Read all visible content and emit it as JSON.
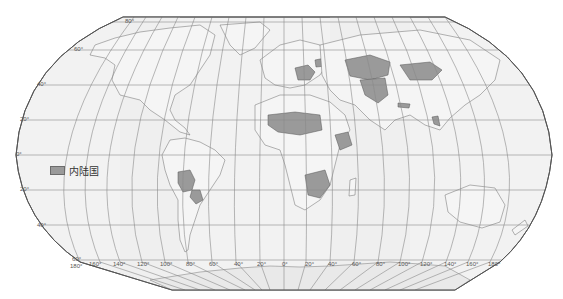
{
  "map": {
    "projection": "Robinson-like world projection",
    "background_color": "#f1f1f1",
    "land_fill": "#f4f4f4",
    "highlight_fill": "#9a9a9a",
    "border_color": "#6a6a6a",
    "graticule_color": "#8a8a8a"
  },
  "legend": {
    "label": "内陆国",
    "swatch_color": "#9a9a9a"
  },
  "latitude_labels": [
    {
      "text": "80°",
      "x": 66,
      "y": 22
    },
    {
      "text": "60°",
      "x": 15,
      "y": 48
    },
    {
      "text": "40°",
      "x": 37,
      "y": 85
    },
    {
      "text": "20°",
      "x": 19,
      "y": 119
    },
    {
      "text": "0°",
      "x": 16,
      "y": 154
    },
    {
      "text": "20°",
      "x": 19,
      "y": 189
    },
    {
      "text": "40°",
      "x": 37,
      "y": 224
    },
    {
      "text": "60°",
      "x": 72,
      "y": 256
    }
  ],
  "longitude_labels": [
    {
      "text": "180°",
      "x": 71,
      "y": 262
    },
    {
      "text": "160°",
      "x": 89,
      "y": 262
    },
    {
      "text": "140°",
      "x": 113,
      "y": 262
    },
    {
      "text": "120°",
      "x": 137,
      "y": 262
    },
    {
      "text": "100°",
      "x": 160,
      "y": 262
    },
    {
      "text": "80°",
      "x": 186,
      "y": 262
    },
    {
      "text": "60°",
      "x": 209,
      "y": 262
    },
    {
      "text": "40°",
      "x": 233,
      "y": 262
    },
    {
      "text": "20°",
      "x": 257,
      "y": 262
    },
    {
      "text": "0°",
      "x": 282,
      "y": 262
    },
    {
      "text": "20°",
      "x": 304,
      "y": 262
    },
    {
      "text": "40°",
      "x": 328,
      "y": 262
    },
    {
      "text": "60°",
      "x": 352,
      "y": 262
    },
    {
      "text": "80°",
      "x": 376,
      "y": 262
    },
    {
      "text": "100°",
      "x": 398,
      "y": 262
    },
    {
      "text": "120°",
      "x": 420,
      "y": 262
    },
    {
      "text": "140°",
      "x": 444,
      "y": 262
    },
    {
      "text": "160°",
      "x": 466,
      "y": 262
    },
    {
      "text": "180°",
      "x": 488,
      "y": 262
    }
  ],
  "highlighted_regions": [
    "Mongolia",
    "Kazakhstan",
    "Uzbekistan",
    "Turkmenistan",
    "Kyrgyzstan",
    "Tajikistan",
    "Afghanistan",
    "Nepal",
    "Bhutan",
    "Laos",
    "Armenia",
    "Azerbaijan",
    "Belarus",
    "Czech Republic",
    "Slovakia",
    "Austria",
    "Hungary",
    "Switzerland",
    "Serbia",
    "North Macedonia",
    "Moldova",
    "Mali",
    "Niger",
    "Chad",
    "Burkina Faso",
    "Central African Republic",
    "South Sudan",
    "Ethiopia",
    "Uganda",
    "Rwanda",
    "Burundi",
    "Zambia",
    "Malawi",
    "Zimbabwe",
    "Botswana",
    "Lesotho",
    "Eswatini",
    "Bolivia",
    "Paraguay"
  ]
}
